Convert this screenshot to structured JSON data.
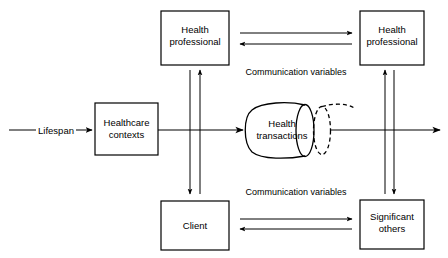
{
  "diagram": {
    "background_color": "#ffffff",
    "line_color": "#000000",
    "nodes": [
      {
        "id": "health-professional-left",
        "label_line1": "Health",
        "label_line2": "professional",
        "shape": "rectangle"
      },
      {
        "id": "health-professional-right",
        "label_line1": "Health",
        "label_line2": "professional",
        "shape": "rectangle"
      },
      {
        "id": "healthcare-contexts",
        "label_line1": "Healthcare",
        "label_line2": "contexts",
        "shape": "rectangle"
      },
      {
        "id": "client",
        "label_line1": "Client",
        "label_line2": "",
        "shape": "rectangle"
      },
      {
        "id": "significant-others",
        "label_line1": "Significant",
        "label_line2": "others",
        "shape": "rectangle"
      },
      {
        "id": "health-transactions",
        "label_line1": "Health",
        "label_line2": "transactions",
        "shape": "cylinder"
      }
    ],
    "edge_labels": {
      "lifespan": "Lifespan",
      "communication_variables_top": "Communication variables",
      "communication_variables_bottom": "Communication variables"
    }
  }
}
